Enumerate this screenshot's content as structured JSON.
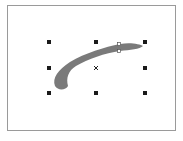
{
  "canvas": {
    "background": "#ffffff",
    "frame": {
      "x": 7,
      "y": 5,
      "width": 169,
      "height": 126,
      "border_color": "#9a9a9a"
    }
  },
  "selected_object": {
    "type": "brush-stroke",
    "fill_color": "#7a7a7a",
    "path": "M55,86 C52,78 58,70 70,62 C85,53 105,47 120,44 C130,42 140,44 143,46 C140,49 130,50 120,51 C105,53 88,59 76,66 C68,71 66,78 68,86 C66,90 58,91 55,86 Z",
    "node": {
      "x": 119,
      "y": 44
    },
    "node_bottom": {
      "x": 119,
      "y": 51
    }
  },
  "selection": {
    "handle_color": "#1a1a1a",
    "handles": [
      {
        "name": "top-left",
        "x": 49,
        "y": 42
      },
      {
        "name": "top-center",
        "x": 96,
        "y": 42
      },
      {
        "name": "top-right",
        "x": 145,
        "y": 42
      },
      {
        "name": "middle-left",
        "x": 49,
        "y": 68
      },
      {
        "name": "middle-right",
        "x": 145,
        "y": 68
      },
      {
        "name": "bottom-left",
        "x": 49,
        "y": 93
      },
      {
        "name": "bottom-center",
        "x": 96,
        "y": 93
      },
      {
        "name": "bottom-right",
        "x": 145,
        "y": 93
      }
    ],
    "center_marker": {
      "x": 96,
      "y": 68,
      "glyph": "×"
    }
  }
}
